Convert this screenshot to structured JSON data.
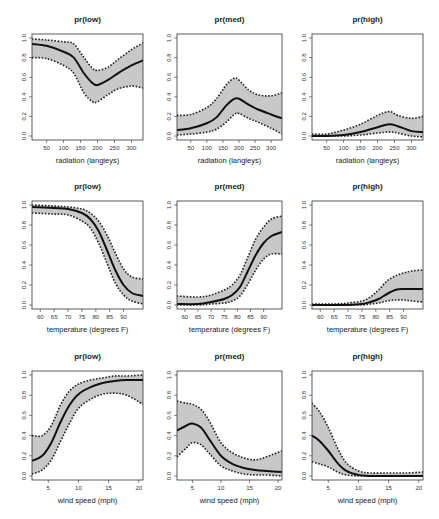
{
  "figure": {
    "layout": {
      "rows": 3,
      "cols": 3
    },
    "colors": {
      "band": "#c8c8c8",
      "fit": "#111111",
      "ci": "#222222",
      "box": "#333333"
    }
  },
  "chart_data": [
    {
      "type": "line",
      "title": "pr(low)",
      "xlabel": "radiation (langleys)",
      "ylabel": "",
      "xlim": [
        7,
        334
      ],
      "ylim": [
        0,
        1.0
      ],
      "xticks": [
        50,
        100,
        150,
        200,
        250,
        300
      ],
      "yticks": [
        0.0,
        0.2,
        0.4,
        0.6,
        0.8,
        1.0
      ],
      "x": [
        7,
        50,
        100,
        130,
        160,
        185,
        200,
        230,
        260,
        300,
        334
      ],
      "series": [
        {
          "name": "fit",
          "values": [
            0.94,
            0.92,
            0.86,
            0.8,
            0.64,
            0.54,
            0.52,
            0.57,
            0.64,
            0.72,
            0.77
          ]
        },
        {
          "name": "upper",
          "values": [
            0.99,
            0.98,
            0.96,
            0.94,
            0.8,
            0.69,
            0.67,
            0.7,
            0.78,
            0.88,
            0.95
          ]
        },
        {
          "name": "lower",
          "values": [
            0.8,
            0.79,
            0.72,
            0.64,
            0.44,
            0.35,
            0.35,
            0.42,
            0.48,
            0.51,
            0.49
          ]
        }
      ]
    },
    {
      "type": "line",
      "title": "pr(med)",
      "xlabel": "radiation (langleys)",
      "ylabel": "",
      "xlim": [
        7,
        334
      ],
      "ylim": [
        0,
        1.0
      ],
      "xticks": [
        50,
        100,
        150,
        200,
        250,
        300
      ],
      "yticks": [
        0.0,
        0.2,
        0.4,
        0.6,
        0.8,
        1.0
      ],
      "x": [
        7,
        50,
        100,
        130,
        160,
        185,
        200,
        230,
        260,
        300,
        334
      ],
      "series": [
        {
          "name": "fit",
          "values": [
            0.06,
            0.08,
            0.13,
            0.19,
            0.31,
            0.38,
            0.38,
            0.32,
            0.27,
            0.22,
            0.18
          ]
        },
        {
          "name": "upper",
          "values": [
            0.21,
            0.22,
            0.29,
            0.38,
            0.52,
            0.59,
            0.57,
            0.47,
            0.42,
            0.41,
            0.44
          ]
        },
        {
          "name": "lower",
          "values": [
            0.01,
            0.02,
            0.04,
            0.07,
            0.14,
            0.22,
            0.23,
            0.18,
            0.14,
            0.08,
            0.02
          ]
        }
      ]
    },
    {
      "type": "line",
      "title": "pr(high)",
      "xlabel": "radiation (langleys)",
      "ylabel": "",
      "xlim": [
        7,
        334
      ],
      "ylim": [
        0,
        1.0
      ],
      "xticks": [
        50,
        100,
        150,
        200,
        250,
        300
      ],
      "yticks": [
        0.0,
        0.2,
        0.4,
        0.6,
        0.8,
        1.0
      ],
      "x": [
        7,
        50,
        100,
        150,
        200,
        235,
        260,
        300,
        334
      ],
      "series": [
        {
          "name": "fit",
          "values": [
            0.0,
            0.0,
            0.01,
            0.04,
            0.09,
            0.12,
            0.1,
            0.05,
            0.04
          ]
        },
        {
          "name": "upper",
          "values": [
            0.02,
            0.02,
            0.06,
            0.12,
            0.21,
            0.25,
            0.21,
            0.18,
            0.2
          ]
        },
        {
          "name": "lower",
          "values": [
            0.0,
            0.0,
            0.0,
            0.01,
            0.03,
            0.04,
            0.03,
            0.0,
            -0.01
          ]
        }
      ]
    },
    {
      "type": "line",
      "title": "pr(low)",
      "xlabel": "temperature (degrees F)",
      "ylabel": "",
      "xlim": [
        57,
        97
      ],
      "ylim": [
        0,
        1.0
      ],
      "xticks": [
        60,
        65,
        70,
        75,
        80,
        85,
        90
      ],
      "yticks": [
        0.0,
        0.2,
        0.4,
        0.6,
        0.8,
        1.0
      ],
      "x": [
        57,
        65,
        70,
        75,
        78,
        81,
        84,
        87,
        90,
        93,
        97
      ],
      "series": [
        {
          "name": "fit",
          "values": [
            0.98,
            0.97,
            0.96,
            0.92,
            0.86,
            0.74,
            0.55,
            0.35,
            0.2,
            0.12,
            0.09
          ]
        },
        {
          "name": "upper",
          "values": [
            1.0,
            0.99,
            0.98,
            0.96,
            0.92,
            0.84,
            0.7,
            0.52,
            0.36,
            0.28,
            0.26
          ]
        },
        {
          "name": "lower",
          "values": [
            0.92,
            0.91,
            0.9,
            0.84,
            0.77,
            0.62,
            0.42,
            0.22,
            0.1,
            0.04,
            0.01
          ]
        }
      ]
    },
    {
      "type": "line",
      "title": "pr(med)",
      "xlabel": "temperature (degrees F)",
      "ylabel": "",
      "xlim": [
        57,
        97
      ],
      "ylim": [
        0,
        1.0
      ],
      "xticks": [
        60,
        65,
        70,
        75,
        80,
        85,
        90
      ],
      "yticks": [
        0.0,
        0.2,
        0.4,
        0.6,
        0.8,
        1.0
      ],
      "x": [
        57,
        65,
        70,
        75,
        78,
        81,
        84,
        87,
        90,
        93,
        97
      ],
      "series": [
        {
          "name": "fit",
          "values": [
            0.01,
            0.01,
            0.03,
            0.06,
            0.1,
            0.18,
            0.34,
            0.5,
            0.62,
            0.69,
            0.73
          ]
        },
        {
          "name": "upper",
          "values": [
            0.09,
            0.08,
            0.1,
            0.15,
            0.2,
            0.3,
            0.48,
            0.66,
            0.78,
            0.86,
            0.89
          ]
        },
        {
          "name": "lower",
          "values": [
            0.0,
            0.0,
            0.01,
            0.02,
            0.04,
            0.09,
            0.21,
            0.35,
            0.46,
            0.51,
            0.51
          ]
        }
      ]
    },
    {
      "type": "line",
      "title": "pr(high)",
      "xlabel": "temperature (degrees F)",
      "ylabel": "",
      "xlim": [
        57,
        97
      ],
      "ylim": [
        0,
        1.0
      ],
      "xticks": [
        60,
        65,
        70,
        75,
        80,
        85,
        90
      ],
      "yticks": [
        0.0,
        0.2,
        0.4,
        0.6,
        0.8,
        1.0
      ],
      "x": [
        57,
        65,
        70,
        75,
        78,
        81,
        84,
        87,
        90,
        93,
        97
      ],
      "series": [
        {
          "name": "fit",
          "values": [
            0.0,
            0.0,
            0.0,
            0.01,
            0.03,
            0.06,
            0.11,
            0.15,
            0.16,
            0.16,
            0.16
          ]
        },
        {
          "name": "upper",
          "values": [
            0.01,
            0.01,
            0.02,
            0.04,
            0.08,
            0.15,
            0.24,
            0.29,
            0.32,
            0.34,
            0.35
          ]
        },
        {
          "name": "lower",
          "values": [
            0.0,
            0.0,
            0.0,
            0.0,
            0.01,
            0.02,
            0.04,
            0.05,
            0.05,
            0.04,
            0.03
          ]
        }
      ]
    },
    {
      "type": "line",
      "title": "pr(low)",
      "xlabel": "wind speed (mph)",
      "ylabel": "",
      "xlim": [
        2.3,
        20.7
      ],
      "ylim": [
        0,
        1.0
      ],
      "xticks": [
        5,
        10,
        15,
        20
      ],
      "yticks": [
        0.0,
        0.2,
        0.4,
        0.6,
        0.8,
        1.0
      ],
      "x": [
        2.3,
        4,
        5.5,
        7,
        8.5,
        10,
        12,
        14,
        16,
        18,
        20.7
      ],
      "series": [
        {
          "name": "fit",
          "values": [
            0.15,
            0.2,
            0.33,
            0.53,
            0.7,
            0.81,
            0.88,
            0.92,
            0.94,
            0.95,
            0.95
          ]
        },
        {
          "name": "upper",
          "values": [
            0.4,
            0.4,
            0.5,
            0.7,
            0.84,
            0.91,
            0.95,
            0.97,
            0.99,
            0.99,
            1.0
          ]
        },
        {
          "name": "lower",
          "values": [
            0.02,
            0.06,
            0.16,
            0.34,
            0.52,
            0.67,
            0.76,
            0.81,
            0.82,
            0.8,
            0.71
          ]
        }
      ]
    },
    {
      "type": "line",
      "title": "pr(med)",
      "xlabel": "wind speed (mph)",
      "ylabel": "",
      "xlim": [
        2.3,
        20.7
      ],
      "ylim": [
        0,
        1.0
      ],
      "xticks": [
        5,
        10,
        15,
        20
      ],
      "yticks": [
        0.0,
        0.2,
        0.4,
        0.6,
        0.8,
        1.0
      ],
      "x": [
        2.3,
        4,
        5,
        6.5,
        8,
        10,
        12,
        14,
        16,
        18,
        20.7
      ],
      "series": [
        {
          "name": "fit",
          "values": [
            0.45,
            0.5,
            0.52,
            0.48,
            0.36,
            0.2,
            0.12,
            0.08,
            0.06,
            0.05,
            0.04
          ]
        },
        {
          "name": "upper",
          "values": [
            0.74,
            0.72,
            0.71,
            0.66,
            0.54,
            0.33,
            0.23,
            0.18,
            0.16,
            0.19,
            0.25
          ]
        },
        {
          "name": "lower",
          "values": [
            0.19,
            0.28,
            0.33,
            0.31,
            0.22,
            0.1,
            0.05,
            0.02,
            0.01,
            0.01,
            0.0
          ]
        }
      ]
    },
    {
      "type": "line",
      "title": "pr(high)",
      "xlabel": "wind speed (mph)",
      "ylabel": "",
      "xlim": [
        2.3,
        20.7
      ],
      "ylim": [
        0,
        1.0
      ],
      "xticks": [
        5,
        10,
        15,
        20
      ],
      "yticks": [
        0.0,
        0.2,
        0.4,
        0.6,
        0.8,
        1.0
      ],
      "x": [
        2.3,
        3.5,
        5,
        6.5,
        8,
        10,
        12,
        15,
        18,
        20.7
      ],
      "series": [
        {
          "name": "fit",
          "values": [
            0.4,
            0.35,
            0.25,
            0.13,
            0.05,
            0.01,
            0.0,
            0.0,
            0.0,
            0.0
          ]
        },
        {
          "name": "upper",
          "values": [
            0.72,
            0.64,
            0.48,
            0.28,
            0.13,
            0.05,
            0.03,
            0.03,
            0.03,
            0.04
          ]
        },
        {
          "name": "lower",
          "values": [
            0.14,
            0.12,
            0.09,
            0.04,
            0.01,
            0.0,
            0.0,
            0.0,
            0.0,
            0.0
          ]
        }
      ]
    }
  ]
}
